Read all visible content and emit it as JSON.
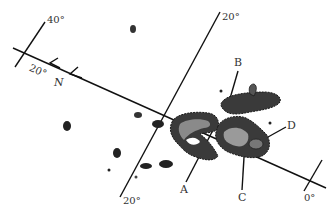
{
  "diagram": {
    "labels": {
      "deg_40": "40°",
      "deg_20_left": "20°",
      "north": "N",
      "deg_20_top": "20°",
      "deg_20_bottom": "20°",
      "deg_0": "0°",
      "spot_a": "A",
      "spot_b": "B",
      "spot_c": "C",
      "spot_d": "D"
    },
    "colors": {
      "line": "#111111",
      "spot_dark": "#2a2a2a",
      "spot_mid": "#6a6a6a",
      "spot_light": "#c8c8c8"
    }
  }
}
